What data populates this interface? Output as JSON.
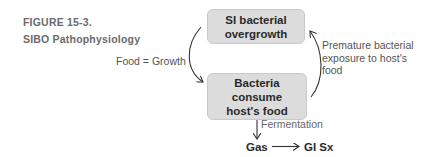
{
  "figure": {
    "number": "FIGURE 15-3.",
    "title": "SIBO Pathophysiology"
  },
  "nodes": {
    "top": {
      "line1": "SI bacterial",
      "line2": "overgrowth"
    },
    "bottom": {
      "line1": "Bacteria consume",
      "line2": "host's food"
    },
    "gas": "Gas",
    "gi_sx": "GI Sx"
  },
  "edges": {
    "left": "Food = Growth",
    "right": [
      "Premature bacterial",
      "exposure to host's",
      "food"
    ],
    "down": "Fermentation"
  },
  "colors": {
    "box_fill": "#dcdcdc",
    "box_border": "#c9c9c9",
    "caption": "#6b6b6b",
    "arrow": "#333333"
  }
}
